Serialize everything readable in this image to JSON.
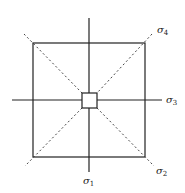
{
  "diagram": {
    "labels": {
      "sigma1": {
        "symbol": "σ",
        "sub": "1"
      },
      "sigma2": {
        "symbol": "σ",
        "sub": "2"
      },
      "sigma3": {
        "symbol": "σ",
        "sub": "3"
      },
      "sigma4": {
        "symbol": "σ",
        "sub": "4"
      }
    },
    "colors": {
      "stroke": "#222222",
      "background": "#ffffff"
    }
  }
}
